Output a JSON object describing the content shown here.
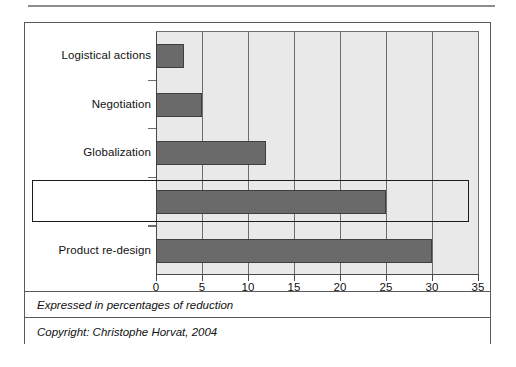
{
  "figure": {
    "caption": "Expressed in percentages of reduction",
    "copyright": "Copyright: Christophe Horvat, 2004"
  },
  "colors": {
    "bar_fill": "#6a6a6a",
    "bar_stroke": "#3f3f3f",
    "plot_background": "#e9e9e9",
    "gridline": "#6d6d6d",
    "axis": "#4a4a4a",
    "highlight_border": "#1b1b1b",
    "card_border": "#5a5a5a"
  },
  "highlight": {
    "category": "International sourcing",
    "extends_to_value": 34
  },
  "chart_data": {
    "type": "bar",
    "orientation": "horizontal",
    "title": "",
    "subtitle": "",
    "xlabel": "Expressed in percentages of reduction",
    "ylabel": "",
    "categories": [
      "Logistical actions",
      "Negotiation",
      "Globalization",
      "International sourcing",
      "Product re-design"
    ],
    "values": [
      3,
      5,
      12,
      25,
      30
    ],
    "xlim": [
      0,
      35
    ],
    "xticks": [
      0,
      5,
      10,
      15,
      20,
      25,
      30,
      35
    ],
    "xtick_labels": [
      "0",
      "5",
      "10",
      "15",
      "20",
      "25",
      "30",
      "35"
    ],
    "grid": "vertical",
    "legend": "none",
    "annotations": [
      {
        "type": "highlight-rectangle",
        "target_category": "International sourcing",
        "note": "black rectangle drawn around the International sourcing row"
      }
    ]
  }
}
